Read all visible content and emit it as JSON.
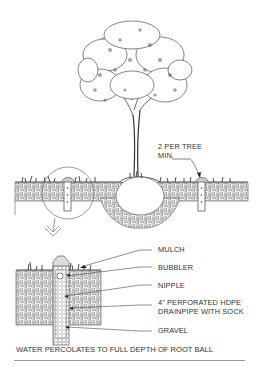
{
  "diagram": {
    "type": "tree-planting-irrigation-detail",
    "elevation_callout": {
      "label_line1": "2 PER TREE",
      "label_line2": "MIN."
    },
    "detail_labels": [
      "MULCH",
      "BUBBLER",
      "NIPPLE",
      "4\" PERFORATED HDPE",
      "DRAINPIPE WITH SOCK",
      "GRAVEL"
    ],
    "caption": "WATER PERCOLATES TO FULL DEPTH OF ROOT BALL",
    "colors": {
      "line": "#333333",
      "hatch": "#8a8a8a",
      "background": "#ffffff"
    }
  }
}
